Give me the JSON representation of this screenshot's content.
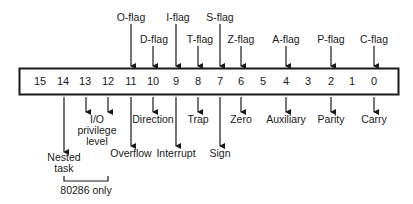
{
  "register": {
    "bits": [
      "15",
      "14",
      "13",
      "12",
      "11",
      "10",
      "9",
      "8",
      "7",
      "6",
      "5",
      "4",
      "3",
      "2",
      "1",
      "0"
    ]
  },
  "top_flags": [
    {
      "label": "O-flag",
      "bit": "11"
    },
    {
      "label": "D-flag",
      "bit": "10"
    },
    {
      "label": "I-flag",
      "bit": "9"
    },
    {
      "label": "T-flag",
      "bit": "8"
    },
    {
      "label": "S-flag",
      "bit": "7"
    },
    {
      "label": "Z-flag",
      "bit": "6"
    },
    {
      "label": "A-flag",
      "bit": "4"
    },
    {
      "label": "P-flag",
      "bit": "2"
    },
    {
      "label": "C-flag",
      "bit": "0"
    }
  ],
  "bottom_labels": {
    "nested_task": [
      "Nested",
      "task"
    ],
    "io_privilege": [
      "I/O",
      "privilege",
      "level"
    ],
    "overflow": "Overflow",
    "direction": "Direction",
    "interrupt": "Interrupt",
    "trap": "Trap",
    "sign": "Sign",
    "zero": "Zero",
    "auxiliary": "Auxiliary",
    "parity": "Parity",
    "carry": "Carry"
  },
  "bracket_note": "80286 only",
  "colors": {
    "ink": "#1a1a1a",
    "background": "#ffffff"
  }
}
